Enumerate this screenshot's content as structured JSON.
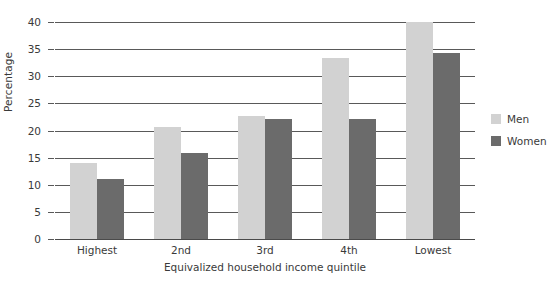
{
  "chart_data": {
    "type": "bar",
    "title": "",
    "xlabel": "Equivalized household income quintile",
    "ylabel": "Percentage",
    "categories": [
      "Highest",
      "2nd",
      "3rd",
      "4th",
      "Lowest"
    ],
    "series": [
      {
        "name": "Men",
        "color": "#d2d2d2",
        "values": [
          14.0,
          20.6,
          22.6,
          33.4,
          40.0
        ]
      },
      {
        "name": "Women",
        "color": "#6b6b6b",
        "values": [
          11.1,
          15.9,
          22.2,
          22.2,
          34.3
        ]
      }
    ],
    "ylim": [
      0,
      40
    ],
    "yticks": [
      0,
      5,
      10,
      15,
      20,
      25,
      30,
      35,
      40
    ],
    "ytick_labels": [
      "0",
      "5",
      "10",
      "15",
      "20",
      "25",
      "30",
      "35",
      "40"
    ],
    "grid": true,
    "grid_axis": "y",
    "legend_position": "right",
    "legend_entries": [
      "Men",
      "Women"
    ],
    "annotations": []
  }
}
